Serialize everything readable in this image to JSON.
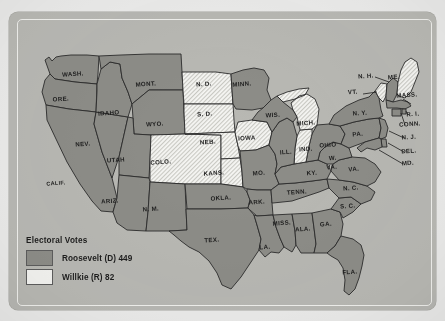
{
  "figure": {
    "kind": "electoral-map",
    "region": "United States (lower 48)",
    "colors": {
      "roosevelt_fill": "#8d8d88",
      "willkie_fill": "#f4f4f1",
      "panel_background": "#b9b9b4",
      "paper_background": "#ececeb",
      "outline": "#2b2b2b",
      "label_text": "#1d1d1d"
    }
  },
  "legend": {
    "title": "Electoral Votes",
    "entries": [
      {
        "swatch": "solid-gray",
        "label": "Roosevelt (D) 449",
        "candidate": "Roosevelt",
        "party": "D",
        "votes": 449
      },
      {
        "swatch": "hatched-white",
        "label": "Willkie (R) 82",
        "candidate": "Willkie",
        "party": "R",
        "votes": 82
      }
    ]
  },
  "chart_data": {
    "type": "map",
    "title": "Electoral Votes",
    "categories": [
      "Roosevelt (D)",
      "Willkie (R)"
    ],
    "values": [
      449,
      82
    ],
    "legend_position": "bottom-left",
    "winner_by_state": {
      "WA": "D",
      "OR": "D",
      "CA": "D",
      "NV": "D",
      "ID": "D",
      "MT": "D",
      "WY": "D",
      "UT": "D",
      "AZ": "D",
      "NM": "D",
      "CO": "R",
      "ND": "R",
      "SD": "R",
      "NE": "R",
      "KS": "R",
      "OK": "D",
      "TX": "D",
      "MN": "D",
      "IA": "R",
      "MO": "D",
      "AR": "D",
      "LA": "D",
      "MS": "D",
      "AL": "D",
      "GA": "D",
      "FL": "D",
      "TN": "D",
      "KY": "D",
      "SC": "D",
      "NC": "D",
      "VA": "D",
      "WV": "D",
      "OH": "D",
      "IN": "R",
      "MI": "R",
      "IL": "D",
      "WI": "D",
      "PA": "D",
      "NY": "D",
      "VT": "R",
      "NH": "D",
      "ME": "R",
      "MA": "D",
      "RI": "D",
      "CT": "D",
      "NJ": "D",
      "DE": "D",
      "MD": "D"
    }
  },
  "states": [
    {
      "code": "WA",
      "label": "WASH.",
      "party": "D",
      "lx": 64,
      "ly": 64
    },
    {
      "code": "OR",
      "label": "ORE.",
      "party": "D",
      "lx": 52,
      "ly": 89
    },
    {
      "code": "CA",
      "label": "CALIF.",
      "party": "D",
      "lx": 47,
      "ly": 173
    },
    {
      "code": "NV",
      "label": "NEV.",
      "party": "D",
      "lx": 74,
      "ly": 134
    },
    {
      "code": "ID",
      "label": "IDAHO",
      "party": "D",
      "lx": 100,
      "ly": 103
    },
    {
      "code": "MT",
      "label": "MONT.",
      "party": "D",
      "lx": 137,
      "ly": 74
    },
    {
      "code": "WY",
      "label": "WYO.",
      "party": "D",
      "lx": 146,
      "ly": 114
    },
    {
      "code": "UT",
      "label": "UTAH",
      "party": "D",
      "lx": 107,
      "ly": 150
    },
    {
      "code": "AZ",
      "label": "ARIZ.",
      "party": "D",
      "lx": 101,
      "ly": 191
    },
    {
      "code": "NM",
      "label": "N. M.",
      "party": "D",
      "lx": 142,
      "ly": 199
    },
    {
      "code": "CO",
      "label": "COLO.",
      "party": "R",
      "lx": 152,
      "ly": 152
    },
    {
      "code": "ND",
      "label": "N. D.",
      "party": "R",
      "lx": 195,
      "ly": 74
    },
    {
      "code": "SD",
      "label": "S. D.",
      "party": "R",
      "lx": 196,
      "ly": 104
    },
    {
      "code": "NE",
      "label": "NEB.",
      "party": "R",
      "lx": 199,
      "ly": 132
    },
    {
      "code": "KS",
      "label": "KANS.",
      "party": "R",
      "lx": 205,
      "ly": 163
    },
    {
      "code": "OK",
      "label": "OKLA.",
      "party": "D",
      "lx": 212,
      "ly": 188
    },
    {
      "code": "TX",
      "label": "TEX.",
      "party": "D",
      "lx": 203,
      "ly": 230
    },
    {
      "code": "MN",
      "label": "MINN.",
      "party": "D",
      "lx": 233,
      "ly": 74
    },
    {
      "code": "IA",
      "label": "IOWA",
      "party": "R",
      "lx": 238,
      "ly": 128
    },
    {
      "code": "MO",
      "label": "MO.",
      "party": "D",
      "lx": 250,
      "ly": 163
    },
    {
      "code": "AR",
      "label": "ARK.",
      "party": "D",
      "lx": 248,
      "ly": 192
    },
    {
      "code": "LA",
      "label": "LA.",
      "party": "D",
      "lx": 256,
      "ly": 237
    },
    {
      "code": "MS",
      "label": "MISS.",
      "party": "D",
      "lx": 273,
      "ly": 213
    },
    {
      "code": "AL",
      "label": "ALA.",
      "party": "D",
      "lx": 294,
      "ly": 219
    },
    {
      "code": "GA",
      "label": "GA.",
      "party": "D",
      "lx": 317,
      "ly": 214
    },
    {
      "code": "FL",
      "label": "FLA.",
      "party": "D",
      "lx": 341,
      "ly": 262
    },
    {
      "code": "TN",
      "label": "TENN.",
      "party": "D",
      "lx": 288,
      "ly": 182
    },
    {
      "code": "KY",
      "label": "KY.",
      "party": "D",
      "lx": 303,
      "ly": 163
    },
    {
      "code": "SC",
      "label": "S. C.",
      "party": "D",
      "lx": 339,
      "ly": 196
    },
    {
      "code": "NC",
      "label": "N. C.",
      "party": "D",
      "lx": 342,
      "ly": 178
    },
    {
      "code": "VA",
      "label": "VA.",
      "party": "D",
      "lx": 345,
      "ly": 159
    },
    {
      "code": "WV",
      "label": "W.",
      "party": "D",
      "lx": 324,
      "ly": 148
    },
    {
      "code": "WV2",
      "label": "VA.",
      "party": "D",
      "lx": 323,
      "ly": 157
    },
    {
      "code": "OH",
      "label": "OHIO",
      "party": "D",
      "lx": 319,
      "ly": 135
    },
    {
      "code": "IN",
      "label": "IND.",
      "party": "R",
      "lx": 297,
      "ly": 139
    },
    {
      "code": "MI",
      "label": "MICH.",
      "party": "R",
      "lx": 297,
      "ly": 113
    },
    {
      "code": "IL",
      "label": "ILL.",
      "party": "D",
      "lx": 277,
      "ly": 142
    },
    {
      "code": "WI",
      "label": "WIS.",
      "party": "D",
      "lx": 264,
      "ly": 105
    },
    {
      "code": "PA",
      "label": "PA.",
      "party": "D",
      "lx": 349,
      "ly": 124
    },
    {
      "code": "NY",
      "label": "N. Y.",
      "party": "D",
      "lx": 351,
      "ly": 103
    },
    {
      "code": "VT",
      "label": "VT.",
      "party": "R",
      "lx": 344,
      "ly": 82
    },
    {
      "code": "NH",
      "label": "N. H.",
      "party": "D",
      "lx": 357,
      "ly": 66
    },
    {
      "code": "ME",
      "label": "ME.",
      "party": "R",
      "lx": 385,
      "ly": 67
    },
    {
      "code": "MA",
      "label": "MASS.",
      "party": "D",
      "lx": 398,
      "ly": 85
    },
    {
      "code": "RI",
      "label": "R. I.",
      "party": "D",
      "lx": 404,
      "ly": 104
    },
    {
      "code": "CT",
      "label": "CONN.",
      "party": "D",
      "lx": 401,
      "ly": 114
    },
    {
      "code": "NJ",
      "label": "N. J.",
      "party": "D",
      "lx": 400,
      "ly": 127
    },
    {
      "code": "DE",
      "label": "DEL.",
      "party": "D",
      "lx": 400,
      "ly": 141
    },
    {
      "code": "MD",
      "label": "MD.",
      "party": "D",
      "lx": 399,
      "ly": 153
    }
  ]
}
